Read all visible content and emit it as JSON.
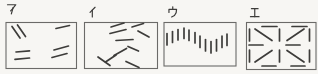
{
  "figure": {
    "type": "multiple-choice-pattern-options",
    "background": "#f7f6f3",
    "ink": "#3d3c3a",
    "border": "#6b6a68",
    "panels": [
      {
        "id": "a",
        "label": "ア",
        "label_pos": [
          7,
          3.5
        ],
        "box": [
          6,
          22.5,
          70.5,
          46
        ],
        "strokes": [
          [
            12,
            26.5,
            20,
            38
          ],
          [
            17.5,
            25,
            25.5,
            36.5
          ],
          [
            56,
            28.5,
            69.5,
            25.5
          ],
          [
            16,
            52,
            29.5,
            50.8
          ],
          [
            15,
            59.3,
            29.5,
            58
          ],
          [
            54,
            50,
            68.5,
            46
          ],
          [
            52,
            57.5,
            67,
            53.5
          ]
        ]
      },
      {
        "id": "i",
        "label": "イ",
        "label_pos": [
          87,
          6.5
        ],
        "box": [
          84.5,
          22.5,
          73,
          46
        ],
        "strokes": [
          [
            111,
            27,
            124,
            23
          ],
          [
            132,
            27,
            143.5,
            23.5
          ],
          [
            110,
            33.5,
            126,
            29.5
          ],
          [
            116,
            40.5,
            133,
            39.5
          ],
          [
            138,
            31,
            149,
            37
          ],
          [
            128,
            46.5,
            138.5,
            51
          ],
          [
            114,
            55.5,
            126.5,
            48.5
          ],
          [
            105.5,
            62,
            116,
            55
          ],
          [
            98,
            57,
            110,
            65.5
          ],
          [
            126,
            61.5,
            139,
            67.5
          ]
        ]
      },
      {
        "id": "u",
        "label": "ウ",
        "label_pos": [
          168,
          6.5
        ],
        "box": [
          164,
          22.5,
          72,
          43.5
        ],
        "strokes": [
          [
            167,
            33.5,
            167,
            45
          ],
          [
            172.5,
            31.5,
            172.5,
            42.5
          ],
          [
            178,
            29.5,
            178,
            40
          ],
          [
            184,
            28,
            184,
            38.5
          ],
          [
            189,
            30,
            189,
            40.5
          ],
          [
            195,
            32.5,
            195,
            43
          ],
          [
            200,
            36,
            200,
            47.5
          ],
          [
            205.5,
            39.5,
            205.5,
            51
          ],
          [
            211,
            41.5,
            211,
            53
          ],
          [
            216.5,
            39.5,
            216.5,
            51
          ],
          [
            222,
            36,
            222,
            47.5
          ],
          [
            227,
            34,
            227,
            45.5
          ]
        ]
      },
      {
        "id": "e",
        "label": "エ",
        "label_pos": [
          250,
          7
        ],
        "box": [
          246.5,
          22.5,
          69.5,
          47
        ],
        "strokes": [
          [
            262,
            26.5,
            277,
            26.5
          ],
          [
            292,
            26.5,
            307,
            26.5
          ],
          [
            249,
            45,
            263,
            45
          ],
          [
            286,
            45,
            300,
            45
          ],
          [
            262,
            66,
            276,
            66
          ],
          [
            291,
            66,
            305,
            66
          ],
          [
            249.5,
            29,
            249.5,
            41
          ],
          [
            279.5,
            29,
            279.5,
            41
          ],
          [
            309.5,
            29,
            309.5,
            41
          ],
          [
            249.5,
            50,
            249.5,
            62
          ],
          [
            279.5,
            50,
            279.5,
            62
          ],
          [
            309.5,
            50,
            309.5,
            62
          ],
          [
            255,
            29,
            272,
            40.5
          ],
          [
            287,
            40.5,
            304,
            29
          ],
          [
            255,
            62,
            272,
            50.5
          ],
          [
            287,
            50.5,
            304,
            62
          ]
        ]
      }
    ],
    "glyphs": {
      "ア": [
        [
          [
            0.5,
            1.3
          ],
          [
            9.3,
            1.3
          ],
          [
            6,
            5.5
          ],
          [
            3.8,
            7.8
          ]
        ],
        [
          [
            6.4,
            4.2
          ],
          [
            4.6,
            11
          ]
        ]
      ],
      "イ": [
        [
          [
            8.5,
            0.8
          ],
          [
            3.2,
            6.2
          ]
        ],
        [
          [
            5.6,
            3.8
          ],
          [
            5.6,
            11
          ]
        ]
      ],
      "ウ": [
        [
          [
            5,
            0.3
          ],
          [
            5,
            2.4
          ]
        ],
        [
          [
            1,
            6.2
          ],
          [
            1,
            3
          ],
          [
            9,
            3
          ],
          [
            8.6,
            6.5
          ],
          [
            6.8,
            9.5
          ],
          [
            3.8,
            11
          ]
        ]
      ],
      "エ": [
        [
          [
            1.5,
            1.8
          ],
          [
            8.5,
            1.8
          ]
        ],
        [
          [
            5,
            1.8
          ],
          [
            5,
            10.2
          ]
        ],
        [
          [
            0.5,
            10.2
          ],
          [
            9.5,
            10.2
          ]
        ]
      ]
    }
  }
}
